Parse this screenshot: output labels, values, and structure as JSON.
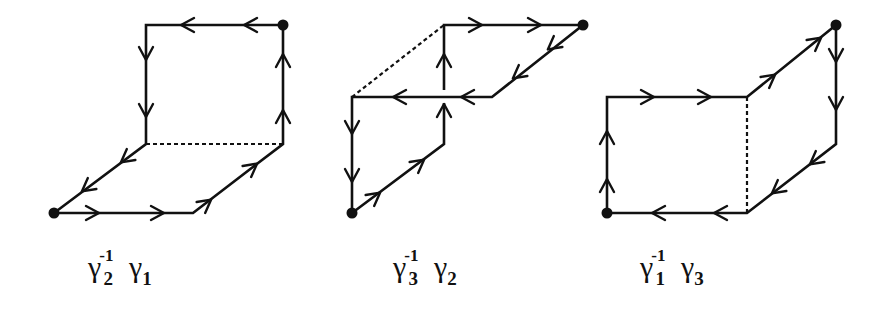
{
  "figure": {
    "panels": [
      {
        "id": "panel-1",
        "label": {
          "base1": "γ",
          "sub1": "2",
          "sup1": "-1",
          "base2": "γ",
          "sub2": "1"
        },
        "label_text": "γ2^-1 γ1",
        "basepoints": [
          [
            54,
            213
          ],
          [
            283,
            25
          ]
        ],
        "solid_paths": [
          [
            [
              54,
              213
            ],
            [
              193,
              213
            ],
            [
              283,
              144
            ],
            [
              283,
              25
            ],
            [
              146,
              25
            ],
            [
              146,
              144
            ],
            [
              54,
              213
            ]
          ]
        ],
        "dashed_paths": [
          [
            [
              146,
              144
            ],
            [
              283,
              144
            ]
          ]
        ],
        "arrows": [
          {
            "at": [
              95,
              213
            ],
            "dir": "right"
          },
          {
            "at": [
              160,
              213
            ],
            "dir": "right"
          },
          {
            "at": [
              208,
              202
            ],
            "dir": "up-right"
          },
          {
            "at": [
              254,
              166
            ],
            "dir": "up-right"
          },
          {
            "at": [
              283,
              114
            ],
            "dir": "up"
          },
          {
            "at": [
              283,
              58
            ],
            "dir": "up"
          },
          {
            "at": [
              248,
              25
            ],
            "dir": "left"
          },
          {
            "at": [
              185,
              25
            ],
            "dir": "left"
          },
          {
            "at": [
              146,
              56
            ],
            "dir": "down"
          },
          {
            "at": [
              146,
              113
            ],
            "dir": "down"
          },
          {
            "at": [
              124,
              160
            ],
            "dir": "down-left"
          },
          {
            "at": [
              85,
              189
            ],
            "dir": "down-left"
          }
        ]
      },
      {
        "id": "panel-2",
        "label": {
          "base1": "γ",
          "sub1": "3",
          "sup1": "-1",
          "base2": "γ",
          "sub2": "2"
        },
        "label_text": "γ3^-1 γ2",
        "basepoints": [
          [
            352,
            213
          ],
          [
            583,
            25
          ]
        ],
        "solid_paths": [
          [
            [
              352,
              213
            ],
            [
              444,
              144
            ],
            [
              444,
              103
            ]
          ],
          [
            [
              444,
              90
            ],
            [
              444,
              25
            ],
            [
              583,
              25
            ],
            [
              492,
              97
            ],
            [
              352,
              97
            ],
            [
              352,
              213
            ]
          ]
        ],
        "dashed_paths": [
          [
            [
              352,
              97
            ],
            [
              444,
              25
            ]
          ]
        ],
        "arrows": [
          {
            "at": [
              377,
              195
            ],
            "dir": "up-right"
          },
          {
            "at": [
              421,
              162
            ],
            "dir": "up-right"
          },
          {
            "at": [
              444,
              108
            ],
            "dir": "up"
          },
          {
            "at": [
              444,
              58
            ],
            "dir": "up"
          },
          {
            "at": [
              478,
              25
            ],
            "dir": "right"
          },
          {
            "at": [
              537,
              25
            ],
            "dir": "right"
          },
          {
            "at": [
              551,
              47
            ],
            "dir": "down-left"
          },
          {
            "at": [
              516,
              76
            ],
            "dir": "down-left"
          },
          {
            "at": [
              465,
              97
            ],
            "dir": "left"
          },
          {
            "at": [
              397,
              97
            ],
            "dir": "left"
          },
          {
            "at": [
              352,
              130
            ],
            "dir": "down"
          },
          {
            "at": [
              352,
              178
            ],
            "dir": "down"
          }
        ]
      },
      {
        "id": "panel-3",
        "label": {
          "base1": "γ",
          "sub1": "1",
          "sup1": "-1",
          "base2": "γ",
          "sub2": "3"
        },
        "label_text": "γ1^-1 γ3",
        "basepoints": [
          [
            607,
            213
          ],
          [
            836,
            25
          ]
        ],
        "solid_paths": [
          [
            [
              607,
              213
            ],
            [
              607,
              97
            ],
            [
              747,
              97
            ],
            [
              836,
              25
            ],
            [
              836,
              144
            ],
            [
              747,
              213
            ],
            [
              607,
              213
            ]
          ]
        ],
        "dashed_paths": [
          [
            [
              747,
              97
            ],
            [
              747,
              213
            ]
          ]
        ],
        "arrows": [
          {
            "at": [
              607,
              183
            ],
            "dir": "up"
          },
          {
            "at": [
              607,
              135
            ],
            "dir": "up"
          },
          {
            "at": [
              650,
              97
            ],
            "dir": "right"
          },
          {
            "at": [
              707,
              97
            ],
            "dir": "right"
          },
          {
            "at": [
              772,
              77
            ],
            "dir": "up-right"
          },
          {
            "at": [
              818,
              40
            ],
            "dir": "up-right"
          },
          {
            "at": [
              836,
              58
            ],
            "dir": "down"
          },
          {
            "at": [
              836,
              106
            ],
            "dir": "down"
          },
          {
            "at": [
              813,
              162
            ],
            "dir": "down-left"
          },
          {
            "at": [
              775,
              191
            ],
            "dir": "down-left"
          },
          {
            "at": [
              718,
              213
            ],
            "dir": "left"
          },
          {
            "at": [
              656,
              213
            ],
            "dir": "left"
          }
        ]
      }
    ],
    "style": {
      "stroke": "#111111",
      "background": "#ffffff"
    }
  }
}
